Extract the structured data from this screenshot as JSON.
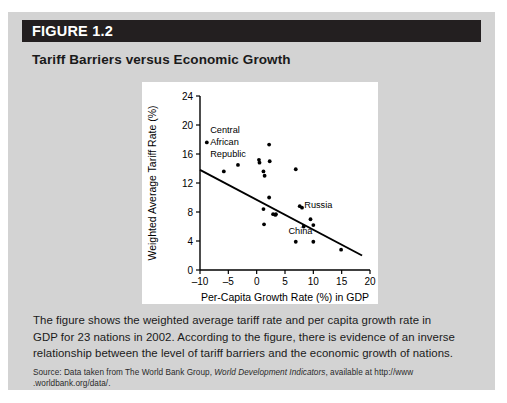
{
  "figure": {
    "header_label": "FIGURE 1.2",
    "title": "Tariff Barriers versus Economic Growth",
    "header_bg": "#231f20",
    "panel_bg": "#d3d3d3",
    "plot_bg": "#ffffff"
  },
  "caption": {
    "line1": "The figure shows the weighted average tariff rate and per capita growth rate in",
    "line2": "GDP for 23 nations in 2002. According to the figure, there is evidence of an inverse",
    "line3": "relationship between the level of tariff barriers and the economic growth of nations."
  },
  "source": {
    "prefix": "Source: Data taken from The World Bank Group, ",
    "italic": "World Development Indicators",
    "suffix": ", available at http://www",
    "line2": ".worldbank.org/data/."
  },
  "chart_data": {
    "type": "scatter",
    "title": "",
    "xlabel": "Per-Capita Growth Rate (%) in GDP",
    "ylabel": "Weighted Average Tariff Rate (%)",
    "xlim": [
      -10,
      20
    ],
    "ylim": [
      0,
      24
    ],
    "xticks": [
      -10,
      -5,
      0,
      5,
      10,
      15,
      20
    ],
    "xtick_labels": [
      "–10",
      "–5",
      "0",
      "5",
      "10",
      "15",
      "20"
    ],
    "yticks": [
      0,
      4,
      8,
      12,
      16,
      20,
      24
    ],
    "ytick_labels": [
      "0",
      "4",
      "8",
      "12",
      "16",
      "20",
      "24"
    ],
    "grid": false,
    "legend": false,
    "n_points": 23,
    "points": [
      {
        "x": -8.8,
        "y": 17.6,
        "label": "Central African Republic"
      },
      {
        "x": -5.8,
        "y": 13.6,
        "label": ""
      },
      {
        "x": -3.3,
        "y": 14.5,
        "label": ""
      },
      {
        "x": 0.4,
        "y": 15.2,
        "label": ""
      },
      {
        "x": 0.5,
        "y": 14.8,
        "label": ""
      },
      {
        "x": 1.2,
        "y": 13.6,
        "label": ""
      },
      {
        "x": 1.4,
        "y": 13.0,
        "label": ""
      },
      {
        "x": 2.2,
        "y": 17.3,
        "label": ""
      },
      {
        "x": 2.3,
        "y": 15.0,
        "label": ""
      },
      {
        "x": 2.2,
        "y": 10.0,
        "label": ""
      },
      {
        "x": 1.2,
        "y": 8.4,
        "label": ""
      },
      {
        "x": 1.3,
        "y": 6.3,
        "label": ""
      },
      {
        "x": 2.9,
        "y": 7.7,
        "label": ""
      },
      {
        "x": 3.3,
        "y": 7.6,
        "label": ""
      },
      {
        "x": 3.4,
        "y": 7.7,
        "label": ""
      },
      {
        "x": 6.9,
        "y": 13.9,
        "label": ""
      },
      {
        "x": 7.6,
        "y": 8.8,
        "label": "Russia"
      },
      {
        "x": 8.0,
        "y": 8.6,
        "label": ""
      },
      {
        "x": 8.3,
        "y": 6.0,
        "label": "China"
      },
      {
        "x": 9.5,
        "y": 7.0,
        "label": ""
      },
      {
        "x": 10.0,
        "y": 6.2,
        "label": ""
      },
      {
        "x": 6.9,
        "y": 3.9,
        "label": ""
      },
      {
        "x": 10.0,
        "y": 3.9,
        "label": ""
      },
      {
        "x": 14.9,
        "y": 2.8,
        "label": ""
      }
    ],
    "annotations": [
      {
        "text": "Central",
        "x": -8.2,
        "y": 19.3
      },
      {
        "text": "African",
        "x": -8.2,
        "y": 17.7
      },
      {
        "text": "Republic",
        "x": -8.2,
        "y": 16.1
      },
      {
        "text": "Russia",
        "x": 8.4,
        "y": 9.0
      },
      {
        "text": "China",
        "x": 5.6,
        "y": 5.5
      }
    ],
    "trendline": {
      "type": "linear-fit",
      "x_start": -10,
      "y_start": 13.8,
      "x_end": 18.6,
      "y_end": 2.0
    }
  }
}
